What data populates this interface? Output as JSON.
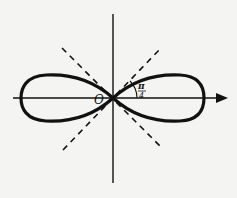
{
  "diagram": {
    "origin_label": "O",
    "angle_label_numerator": "π",
    "angle_label_denominator": "4",
    "curve_color": "#111111",
    "axis_color": "#111111",
    "asymptote_style": "dashed",
    "elements": [
      "x-axis with arrow",
      "y-axis",
      "lemniscate curve",
      "dashed lines y = x and y = -x",
      "angle arc marking π/4"
    ]
  }
}
